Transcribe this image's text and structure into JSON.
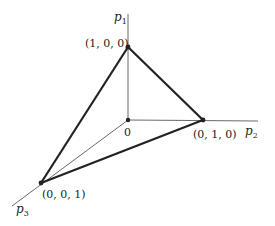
{
  "diagram": {
    "type": "simplex-3d",
    "axes": {
      "p1": {
        "label": "p",
        "subscript": "1"
      },
      "p2": {
        "label": "p",
        "subscript": "2"
      },
      "p3": {
        "label": "p",
        "subscript": "3"
      }
    },
    "origin": {
      "label": "0"
    },
    "vertices": [
      {
        "id": "v100",
        "label": "(1, 0, 0)"
      },
      {
        "id": "v010",
        "label": "(0, 1, 0)"
      },
      {
        "id": "v001",
        "label": "(0, 0, 1)"
      }
    ],
    "colors": {
      "line": "#222222",
      "background": "#ffffff"
    }
  }
}
